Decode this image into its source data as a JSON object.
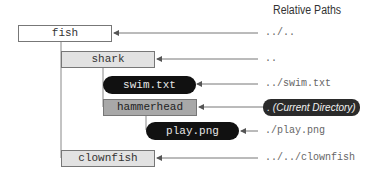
{
  "title": "Relative Paths",
  "nodes": {
    "fish": {
      "label": "fish",
      "type": "directory",
      "path": "../.."
    },
    "shark": {
      "label": "shark",
      "type": "directory",
      "path": ".."
    },
    "swim": {
      "label": "swim.txt",
      "type": "file",
      "path": "../swim.txt"
    },
    "hammerhead": {
      "label": "hammerhead",
      "type": "current-directory",
      "path": ". (Current Directory)"
    },
    "play": {
      "label": "play.png",
      "type": "file",
      "path": "./play.png"
    },
    "clownfish": {
      "label": "clownfish",
      "type": "directory",
      "path": "../../clownfish"
    }
  },
  "colors": {
    "directory_fill": "#e2e2e2",
    "root_fill": "#ffffff",
    "current_fill": "#a8a8a8",
    "file_fill": "#111111",
    "line": "#777777"
  }
}
